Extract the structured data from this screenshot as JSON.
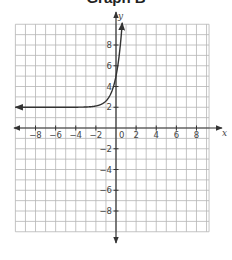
{
  "title": "Graph B",
  "chart_data": {
    "type": "line",
    "title": "Graph B",
    "xlabel": "x",
    "ylabel": "y",
    "xlim": [
      -10,
      9.25
    ],
    "ylim": [
      -10,
      10
    ],
    "grid": true,
    "grid_step": 1,
    "x_ticks": [
      -8,
      -6,
      -4,
      -2,
      0,
      2,
      4,
      6,
      8
    ],
    "y_ticks": [
      8,
      6,
      4,
      2,
      -2,
      -4,
      -6,
      -8
    ],
    "origin_label": "0",
    "series": [
      {
        "name": "y = 3·5^x + 2",
        "description": "exponential growth curve with horizontal asymptote y = 2",
        "asymptote_y": 2,
        "y_intercept": 5,
        "x": [
          -10,
          -6,
          -4,
          -3,
          -2,
          -1.5,
          -1,
          -0.5,
          0,
          0.25,
          0.5,
          0.62
        ],
        "values": [
          2.0,
          2.0,
          2.0,
          2.02,
          2.12,
          2.27,
          2.6,
          3.34,
          5.0,
          6.49,
          8.71,
          9.9
        ],
        "arrows": "both ends",
        "color": "#333333"
      }
    ],
    "colors": {
      "grid": "#b5b5b5",
      "axes": "#333333",
      "curve": "#333333",
      "labels": "#444444"
    }
  }
}
